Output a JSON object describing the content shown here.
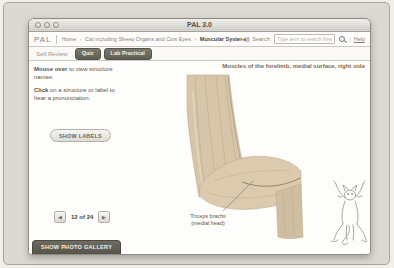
{
  "window": {
    "title": "PAL 3.0"
  },
  "header": {
    "logo": "PAL",
    "breadcrumb": {
      "home": "Home",
      "sep1": "›",
      "module": "Cat including Sheep Organs and Cow Eyes",
      "sep2": "›",
      "current": "Muscular System"
    },
    "audio_glyph": "◀)))",
    "search_label": "Search:",
    "search_placeholder": "Type term to search these topics",
    "divider": "|",
    "help": "Help"
  },
  "tabs": [
    {
      "label": "Self Review",
      "active": true
    },
    {
      "label": "Quiz",
      "active": false
    },
    {
      "label": "Lab Practical",
      "active": false
    }
  ],
  "sidebar": {
    "instruction1": {
      "bold": "Mouse over",
      "rest": " to view structure names."
    },
    "instruction2": {
      "bold": "Click",
      "rest": " on a structure or label to hear a pronunciation."
    },
    "show_labels": "SHOW LABELS",
    "pagination": {
      "prev": "◀",
      "label": "12 of 24",
      "next": "▶"
    },
    "show_gallery": "SHOW PHOTO GALLERY"
  },
  "main": {
    "caption": "Muscles of the forelimb, medial surface, right side",
    "structure_label": {
      "line1": "Triceps brachii",
      "line2": "(medial head)"
    }
  },
  "colors": {
    "page_bg": "#dcd9d2",
    "dark_button": "#5f5d53",
    "caption_text": "#7d6c58",
    "specimen_tan": "#d6c5a9"
  }
}
